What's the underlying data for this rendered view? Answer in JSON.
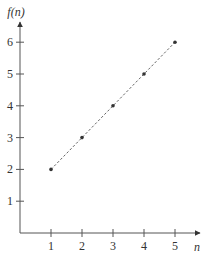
{
  "chart_data": {
    "type": "scatter",
    "title": "",
    "xlabel": "n",
    "ylabel": "f(n)",
    "x": [
      1,
      2,
      3,
      4,
      5
    ],
    "series": [
      {
        "name": "f(n)",
        "values": [
          2,
          3,
          4,
          5,
          6
        ],
        "marker": "dot",
        "connector": "dashed-line"
      }
    ],
    "x_ticks": [
      "1",
      "2",
      "3",
      "4",
      "5"
    ],
    "y_ticks": [
      "1",
      "2",
      "3",
      "4",
      "5",
      "6"
    ],
    "xlim": [
      0,
      5.8
    ],
    "ylim": [
      0,
      7
    ],
    "grid": false,
    "legend": null,
    "colors": {
      "axis": "#555555",
      "points": "#333333",
      "line": "#666666"
    }
  }
}
